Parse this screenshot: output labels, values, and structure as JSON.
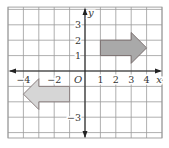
{
  "diagram": {
    "type": "coordinate-plane",
    "x_axis": {
      "label": "x",
      "tick_labels": [
        {
          "value": -4,
          "text": "−4"
        },
        {
          "value": -2,
          "text": "−2"
        },
        {
          "value": 1,
          "text": "1"
        },
        {
          "value": 2,
          "text": "2"
        },
        {
          "value": 3,
          "text": "3"
        },
        {
          "value": 4,
          "text": "4"
        }
      ]
    },
    "y_axis": {
      "label": "y",
      "tick_labels": [
        {
          "value": 3,
          "text": "3"
        },
        {
          "value": 2,
          "text": "2"
        },
        {
          "value": 1,
          "text": "1"
        },
        {
          "value": -3,
          "text": "−3"
        }
      ]
    },
    "origin_label": "O",
    "grid": {
      "x_min": -5,
      "x_max": 5,
      "y_min": -4.35,
      "y_max": 4.15,
      "step": 1
    },
    "shapes": [
      {
        "name": "right-arrow",
        "direction": "right",
        "fill": "#a9a9a9",
        "stroke": "#7a6f6f",
        "points": [
          [
            1,
            1
          ],
          [
            3,
            1
          ],
          [
            3,
            0.5
          ],
          [
            4,
            1.5
          ],
          [
            3,
            2.5
          ],
          [
            3,
            2
          ],
          [
            1,
            2
          ]
        ]
      },
      {
        "name": "left-arrow",
        "direction": "left",
        "fill": "#d6d6d6",
        "stroke": "#8a7f7f",
        "points": [
          [
            -1,
            -1
          ],
          [
            -3,
            -1
          ],
          [
            -3,
            -0.5
          ],
          [
            -4,
            -1.5
          ],
          [
            -3,
            -2.5
          ],
          [
            -3,
            -2
          ],
          [
            -1,
            -2
          ]
        ]
      }
    ],
    "colors": {
      "grid": "#9a9a9a",
      "axis": "#222222",
      "background": "#ffffff"
    }
  }
}
